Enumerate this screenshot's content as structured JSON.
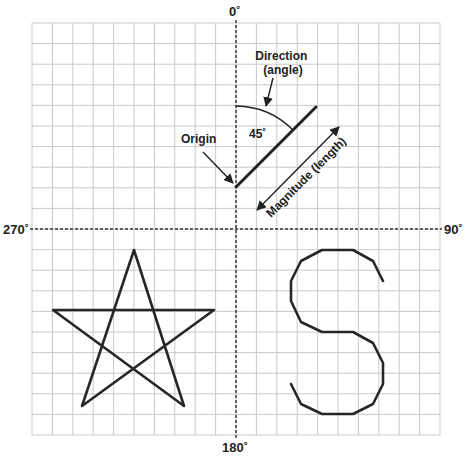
{
  "axes": {
    "top_label": "0˚",
    "right_label": "90˚",
    "bottom_label": "180˚",
    "left_label": "270˚"
  },
  "grid": {
    "columns": 20,
    "rows": 20,
    "left": 32,
    "top": 23,
    "right": 440,
    "bottom": 435,
    "line_color": "#c9c9c9"
  },
  "vector": {
    "angle_label": "45˚",
    "direction_label_line1": "Direction",
    "direction_label_line2": "(angle)",
    "origin_label": "Origin",
    "magnitude_label": "Magnitude (length)",
    "stroke_color": "#222222"
  },
  "shapes": {
    "star": "five-pointed star",
    "letter": "S"
  }
}
